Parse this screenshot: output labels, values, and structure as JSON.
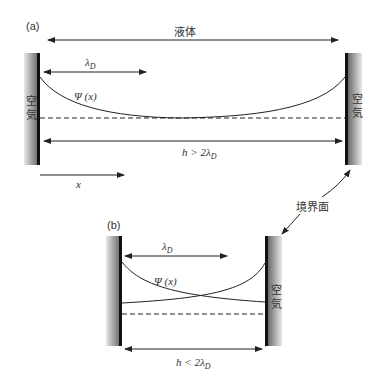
{
  "figure": {
    "panel_a": {
      "label": "(a)",
      "liquid_label": "液体",
      "left_wall_label_top": "空",
      "left_wall_label_bottom": "気",
      "right_wall_label_top": "空",
      "right_wall_label_bottom": "気",
      "debye_length_label": "λ",
      "debye_length_sub": "D",
      "potential_label": "Ψ (x)",
      "separation_label": "h > 2λ",
      "separation_sub": "D",
      "x_axis_label": "x"
    },
    "panel_b": {
      "label": "(b)",
      "right_wall_label_top": "空",
      "right_wall_label_bottom": "気",
      "debye_length_label": "λ",
      "debye_length_sub": "D",
      "potential_label": "Ψ (x)",
      "separation_label": "h < 2λ",
      "separation_sub": "D"
    },
    "interface_label": "境界面"
  },
  "colors": {
    "line": "#222222",
    "wall_dark": "#1a1a1a",
    "wall_light": "#e6e6e6",
    "text": "#333333"
  }
}
